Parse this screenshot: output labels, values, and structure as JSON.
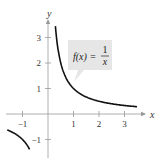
{
  "chart_data": {
    "type": "line",
    "title": "",
    "function": "f(x) = 1/x",
    "annotation": {
      "lhs": "f(x) =",
      "num": "1",
      "den": "x"
    },
    "xlabel": "x",
    "ylabel": "y",
    "xlim": [
      -1.5,
      3.8
    ],
    "ylim": [
      -1.4,
      3.8
    ],
    "x_ticks": [
      -1,
      1,
      2,
      3
    ],
    "x_tick_labels": [
      "−1",
      "1",
      "2",
      "3"
    ],
    "y_ticks": [
      -1,
      1,
      2,
      3
    ],
    "y_tick_labels": [
      "−1",
      "1",
      "2",
      "3"
    ],
    "grid": false,
    "legend": "none",
    "series": [
      {
        "name": "f(x) = 1/x, x>0",
        "x": [
          0.29,
          0.35,
          0.5,
          0.75,
          1,
          1.5,
          2,
          2.5,
          3,
          3.5
        ],
        "y": [
          3.45,
          2.86,
          2.0,
          1.33,
          1.0,
          0.67,
          0.5,
          0.4,
          0.33,
          0.29
        ]
      },
      {
        "name": "f(x) = 1/x, x<0",
        "x": [
          -1.5,
          -1.25,
          -1.0,
          -0.75,
          -0.7
        ],
        "y": [
          -0.67,
          -0.8,
          -1.0,
          -1.33,
          -1.43
        ]
      }
    ],
    "colors": {
      "curve": "#111111",
      "axis": "#999999",
      "label_box": "#e6e6e6"
    }
  }
}
